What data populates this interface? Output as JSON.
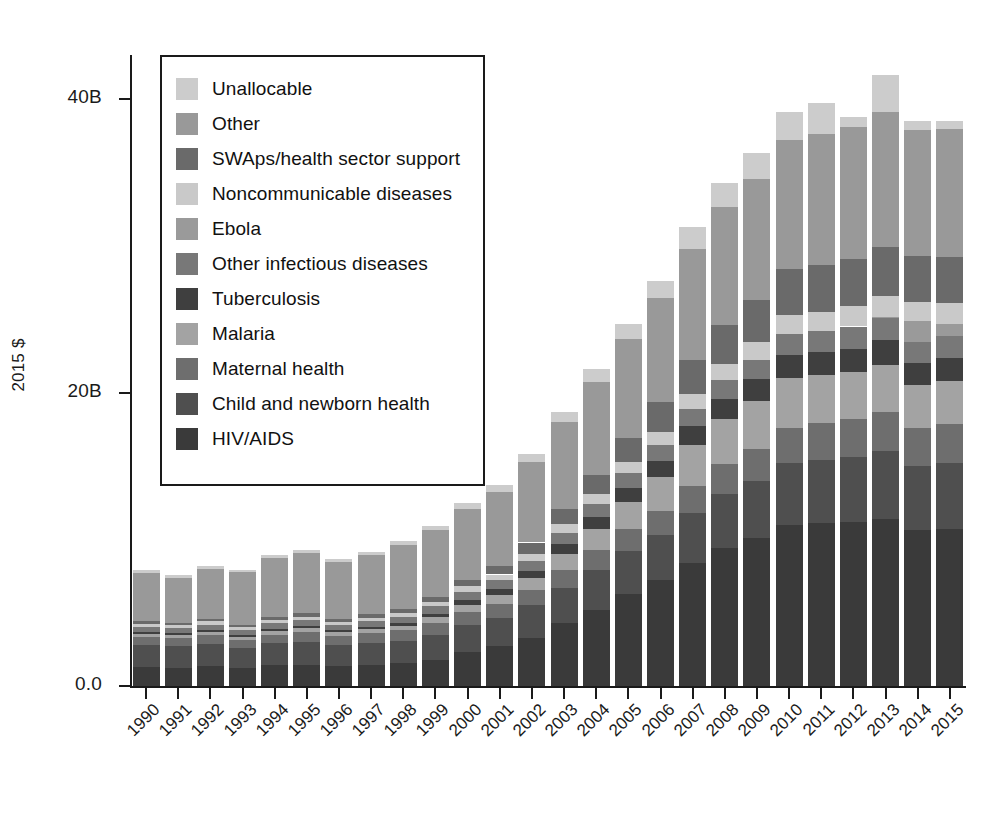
{
  "chart_data": {
    "type": "bar",
    "subtype": "stacked-bar",
    "title": "",
    "xlabel": "",
    "ylabel": "2015 $",
    "ylim": [
      0,
      43
    ],
    "yticks": [
      0,
      20,
      40
    ],
    "ytick_labels": [
      "0.0",
      "20B",
      "40B"
    ],
    "grid": false,
    "legend_position": "upper-left-inside",
    "units": "Billions of 2015 US dollars",
    "categories": [
      "1990",
      "1991",
      "1992",
      "1993",
      "1994",
      "1995",
      "1996",
      "1997",
      "1998",
      "1999",
      "2000",
      "2001",
      "2002",
      "2003",
      "2004",
      "2005",
      "2006",
      "2007",
      "2008",
      "2009",
      "2010",
      "2011",
      "2012",
      "2013",
      "2014",
      "2015"
    ],
    "series": [
      {
        "name": "HIV/AIDS",
        "color": "#3a3a3a",
        "values": [
          1.3,
          1.25,
          1.35,
          1.25,
          1.4,
          1.45,
          1.35,
          1.45,
          1.55,
          1.8,
          2.3,
          2.7,
          3.3,
          4.3,
          5.2,
          6.3,
          7.2,
          8.4,
          9.4,
          10.1,
          11.0,
          11.1,
          11.2,
          11.4,
          10.6,
          10.7
        ]
      },
      {
        "name": "Child and newborn health",
        "color": "#4f4f4f",
        "values": [
          1.5,
          1.45,
          1.5,
          1.35,
          1.5,
          1.55,
          1.45,
          1.5,
          1.55,
          1.7,
          1.85,
          1.95,
          2.2,
          2.4,
          2.7,
          2.9,
          3.1,
          3.4,
          3.7,
          3.9,
          4.2,
          4.3,
          4.4,
          4.6,
          4.4,
          4.5
        ]
      },
      {
        "name": "Maternal health",
        "color": "#6e6e6e",
        "values": [
          0.55,
          0.55,
          0.6,
          0.55,
          0.6,
          0.65,
          0.6,
          0.65,
          0.7,
          0.8,
          0.9,
          0.95,
          1.05,
          1.2,
          1.35,
          1.5,
          1.65,
          1.85,
          2.0,
          2.15,
          2.4,
          2.5,
          2.6,
          2.7,
          2.6,
          2.65
        ]
      },
      {
        "name": "Malaria",
        "color": "#a3a3a3",
        "values": [
          0.22,
          0.22,
          0.25,
          0.22,
          0.26,
          0.28,
          0.26,
          0.28,
          0.32,
          0.4,
          0.5,
          0.6,
          0.8,
          1.1,
          1.45,
          1.85,
          2.3,
          2.8,
          3.1,
          3.3,
          3.4,
          3.3,
          3.2,
          3.2,
          2.9,
          2.95
        ]
      },
      {
        "name": "Tuberculosis",
        "color": "#3f3f3f",
        "values": [
          0.12,
          0.12,
          0.13,
          0.12,
          0.14,
          0.15,
          0.14,
          0.15,
          0.17,
          0.22,
          0.3,
          0.38,
          0.5,
          0.65,
          0.8,
          0.95,
          1.1,
          1.25,
          1.35,
          1.45,
          1.55,
          1.55,
          1.6,
          1.65,
          1.5,
          1.55
        ]
      },
      {
        "name": "Other infectious diseases",
        "color": "#787878",
        "values": [
          0.35,
          0.34,
          0.36,
          0.33,
          0.38,
          0.4,
          0.37,
          0.4,
          0.44,
          0.5,
          0.58,
          0.62,
          0.7,
          0.8,
          0.9,
          1.0,
          1.1,
          1.2,
          1.3,
          1.35,
          1.45,
          1.45,
          1.5,
          1.55,
          1.45,
          1.5
        ]
      },
      {
        "name": "Ebola",
        "color": "#9a9a9a",
        "values": [
          0,
          0,
          0,
          0,
          0,
          0,
          0,
          0,
          0,
          0,
          0,
          0,
          0,
          0,
          0,
          0,
          0,
          0,
          0,
          0,
          0,
          0,
          0,
          0.05,
          1.4,
          0.85
        ]
      },
      {
        "name": "Noncommunicable diseases",
        "color": "#c9c9c9",
        "values": [
          0.2,
          0.2,
          0.21,
          0.19,
          0.22,
          0.23,
          0.21,
          0.23,
          0.25,
          0.3,
          0.36,
          0.4,
          0.48,
          0.58,
          0.68,
          0.78,
          0.88,
          1.0,
          1.1,
          1.18,
          1.3,
          1.32,
          1.38,
          1.45,
          1.35,
          1.4
        ]
      },
      {
        "name": "SWAps/health sector support",
        "color": "#6a6a6a",
        "values": [
          0.18,
          0.18,
          0.2,
          0.18,
          0.22,
          0.24,
          0.22,
          0.24,
          0.28,
          0.34,
          0.45,
          0.55,
          0.75,
          1.0,
          1.3,
          1.65,
          2.0,
          2.35,
          2.65,
          2.85,
          3.1,
          3.15,
          3.2,
          3.3,
          3.1,
          3.15
        ]
      },
      {
        "name": "Other",
        "color": "#999999",
        "values": [
          3.3,
          3.05,
          3.35,
          3.55,
          4.0,
          4.1,
          3.85,
          4.0,
          4.35,
          4.55,
          4.85,
          5.1,
          5.5,
          5.95,
          6.35,
          6.75,
          7.1,
          7.55,
          8.05,
          8.3,
          8.8,
          8.95,
          9.0,
          9.25,
          8.6,
          8.7
        ]
      },
      {
        "name": "Unallocable",
        "color": "#cccccc",
        "values": [
          0.18,
          0.18,
          0.2,
          0.2,
          0.22,
          0.24,
          0.22,
          0.24,
          0.28,
          0.32,
          0.4,
          0.45,
          0.55,
          0.7,
          0.85,
          1.0,
          1.2,
          1.45,
          1.6,
          1.75,
          1.95,
          2.1,
          0.7,
          2.5,
          0.6,
          0.55
        ]
      }
    ],
    "totals": [
      7.9,
      7.54,
      8.15,
      7.94,
      8.94,
      9.29,
      8.67,
      9.14,
      9.89,
      10.93,
      12.49,
      13.7,
      16.83,
      18.68,
      21.58,
      24.68,
      27.63,
      30.65,
      33.35,
      35.33,
      38.15,
      38.72,
      38.18,
      41.65,
      38.5,
      38.5
    ]
  },
  "legend": {
    "items": [
      {
        "label": "Unallocable",
        "color": "#cccccc"
      },
      {
        "label": "Other",
        "color": "#999999"
      },
      {
        "label": "SWAps/health sector support",
        "color": "#6a6a6a"
      },
      {
        "label": "Noncommunicable diseases",
        "color": "#c9c9c9"
      },
      {
        "label": "Ebola",
        "color": "#9a9a9a"
      },
      {
        "label": "Other infectious diseases",
        "color": "#787878"
      },
      {
        "label": "Tuberculosis",
        "color": "#3f3f3f"
      },
      {
        "label": "Malaria",
        "color": "#a3a3a3"
      },
      {
        "label": "Maternal health",
        "color": "#6e6e6e"
      },
      {
        "label": "Child and newborn health",
        "color": "#4f4f4f"
      },
      {
        "label": "HIV/AIDS",
        "color": "#3a3a3a"
      }
    ]
  },
  "axes": {
    "y_title": "2015 $",
    "y_tick_labels": [
      "0.0",
      "20B",
      "40B"
    ],
    "y_tick_values": [
      0,
      20,
      40
    ],
    "x_tick_labels": [
      "1990",
      "1991",
      "1992",
      "1993",
      "1994",
      "1995",
      "1996",
      "1997",
      "1998",
      "1999",
      "2000",
      "2001",
      "2002",
      "2003",
      "2004",
      "2005",
      "2006",
      "2007",
      "2008",
      "2009",
      "2010",
      "2011",
      "2012",
      "2013",
      "2014",
      "2015"
    ]
  },
  "style": {
    "background": "#ffffff",
    "axis_color": "#1a1a1a",
    "text_color": "#1a1a1a",
    "bar_gap_color": "#ffffff"
  }
}
